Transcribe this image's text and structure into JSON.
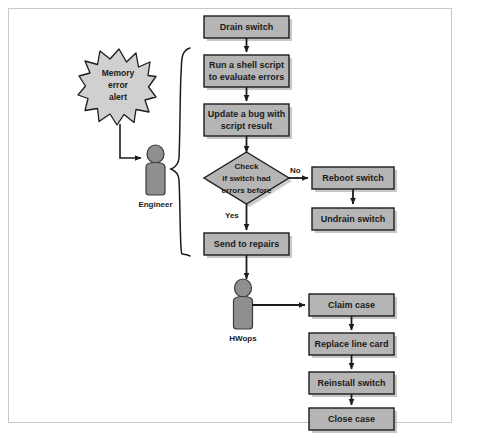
{
  "diagram": {
    "colors": {
      "box_fill": "#b5b5b5",
      "box_stroke": "#1c1c1c",
      "shadow": "#9a9a9a",
      "burst_fill": "#d0d0d0",
      "actor_fill": "#8f8f8f",
      "actor_stroke": "#3a3a3a",
      "line": "#1c1c1c",
      "frame_border": "#c9c9c9",
      "page_background": "#ffffff"
    },
    "alert": {
      "shape": "starburst",
      "lines": [
        "Memory",
        "error",
        "alert"
      ]
    },
    "actors": [
      {
        "id": "engineer",
        "label": "Engineer"
      },
      {
        "id": "hwops",
        "label": "HWops"
      }
    ],
    "nodes": [
      {
        "id": "drain-switch",
        "type": "process",
        "lines": [
          "Drain switch"
        ]
      },
      {
        "id": "run-shell-script",
        "type": "process",
        "lines": [
          "Run a shell script",
          "to evaluate errors"
        ]
      },
      {
        "id": "update-bug",
        "type": "process",
        "lines": [
          "Update a bug with",
          "script result"
        ]
      },
      {
        "id": "check-errors",
        "type": "decision",
        "lines": [
          "Check",
          "if switch had",
          "errors before"
        ]
      },
      {
        "id": "reboot-switch",
        "type": "process",
        "lines": [
          "Reboot switch"
        ]
      },
      {
        "id": "undrain-switch",
        "type": "process",
        "lines": [
          "Undrain switch"
        ]
      },
      {
        "id": "send-to-repairs",
        "type": "process",
        "lines": [
          "Send to repairs"
        ]
      },
      {
        "id": "claim-case",
        "type": "process",
        "lines": [
          "Claim case"
        ]
      },
      {
        "id": "replace-line-card",
        "type": "process",
        "lines": [
          "Replace line card"
        ]
      },
      {
        "id": "reinstall-switch",
        "type": "process",
        "lines": [
          "Reinstall switch"
        ]
      },
      {
        "id": "close-case",
        "type": "process",
        "lines": [
          "Close case"
        ]
      }
    ],
    "edge_labels": [
      {
        "id": "no",
        "text": "No"
      },
      {
        "id": "yes",
        "text": "Yes"
      }
    ],
    "edges": [
      {
        "from": "alert",
        "to": "engineer"
      },
      {
        "from": "drain-switch",
        "to": "run-shell-script"
      },
      {
        "from": "run-shell-script",
        "to": "update-bug"
      },
      {
        "from": "update-bug",
        "to": "check-errors"
      },
      {
        "from": "check-errors",
        "to": "reboot-switch",
        "label": "No"
      },
      {
        "from": "reboot-switch",
        "to": "undrain-switch"
      },
      {
        "from": "check-errors",
        "to": "send-to-repairs",
        "label": "Yes"
      },
      {
        "from": "send-to-repairs",
        "to": "hwops"
      },
      {
        "from": "hwops",
        "to": "claim-case"
      },
      {
        "from": "claim-case",
        "to": "replace-line-card"
      },
      {
        "from": "replace-line-card",
        "to": "reinstall-switch"
      },
      {
        "from": "reinstall-switch",
        "to": "close-case"
      }
    ],
    "brace": {
      "id": "engineer-scope-brace",
      "owner": "engineer"
    }
  }
}
